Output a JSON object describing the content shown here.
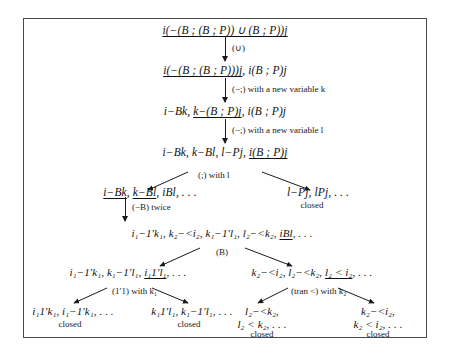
{
  "figure": {
    "frame_color": "#4a4a4a"
  },
  "nodes": {
    "n1": "i(−(B ; (B ; P)) ∪ (B ; P))j",
    "n2_a": "i(−(B ; (B ; P)))j",
    "n2_b": ", i(B ; P)j",
    "n3_a": "i−Bk, ",
    "n3_b": "k−(B ; P)j",
    "n3_c": ", i(B ; P)j",
    "n4_a": "i−Bk, k−Bl, l−Pj, ",
    "n4_b": "i(B ; P)j",
    "n5L_a": "i−Bk",
    "n5L_b": ", ",
    "n5L_c": "k−Bl",
    "n5L_d": ", iBl, . . .",
    "n5R": "l−Pj, lPj, . . .",
    "n6_a": "i₁−1′k₁, k₂−<i₂, k₁−1′l₁, l₂−<k₂, ",
    "n6_b": "iBl",
    "n6_c": ", . . .",
    "n7L_a": "i₁−1′k₁, k₁−1′l₁, ",
    "n7L_b": "i₁1′l₁",
    "n7L_c": ", . . .",
    "n7R_a": "k₂−<i₂, l₂−<k₂, ",
    "n7R_b": "l₂ < i₂",
    "n7R_c": ", . . .",
    "n8a": "i₁1′k₁, i₁−1′k₁, . . .",
    "n8b": "k₁1′l₁, k₁−1′l₁, . . .",
    "n8c_line1": "l₂−<k₂,",
    "n8c_line2": "l₂ < k₂, . . .",
    "n8d_line1": "k₂−<i₂,",
    "n8d_line2": "k₂ < i₂, . . ."
  },
  "rules": {
    "r1": "(∪)",
    "r2": "(−;) with a new variable k",
    "r3": "(−;) with a new variable l",
    "r4": "(;) with l",
    "r5": "(−B) twice",
    "r6": "(B)",
    "r7L": "(1′1) with k₁",
    "r7R": "(tran <) with k₂"
  },
  "labels": {
    "closed": "closed"
  }
}
